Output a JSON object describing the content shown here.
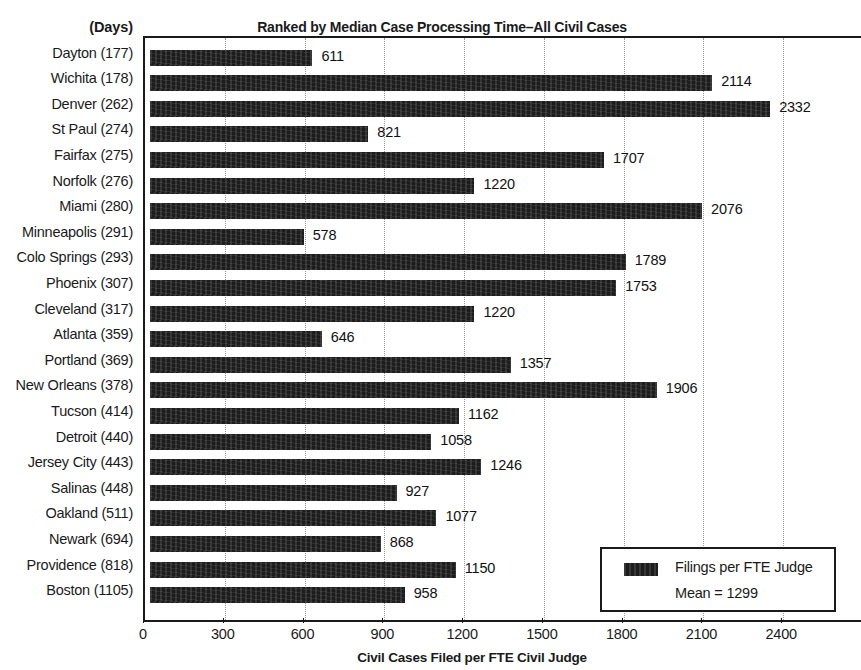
{
  "header": {
    "days_header": "(Days)",
    "title": "Ranked by Median Case Processing Time–All Civil Cases"
  },
  "legend": {
    "series_label": "Filings per FTE Judge",
    "mean_label": "Mean = 1299"
  },
  "chart_data": {
    "type": "bar",
    "orientation": "horizontal",
    "title": "Ranked by Median Case Processing Time–All Civil Cases",
    "xlabel": "Civil Cases Filed per FTE Civil Judge",
    "ylabel": "(Days)",
    "xlim": [
      0,
      2700
    ],
    "xticks": [
      0,
      300,
      600,
      900,
      1200,
      1500,
      1800,
      2100,
      2400
    ],
    "xtick_labels": [
      "0",
      "300",
      "600",
      "900",
      "1200",
      "1500",
      "1800",
      "2100",
      "2400"
    ],
    "grid": "vertical-dotted",
    "legend_position": "bottom-right",
    "series_name": "Filings per FTE Judge",
    "mean": 1299,
    "bar_color": "#1c1c1c",
    "categories": [
      "Dayton (177)",
      "Wichita (178)",
      "Denver (262)",
      "St Paul (274)",
      "Fairfax (275)",
      "Norfolk (276)",
      "Miami (280)",
      "Minneapolis (291)",
      "Colo Springs (293)",
      "Phoenix (307)",
      "Cleveland (317)",
      "Atlanta (359)",
      "Portland (369)",
      "New Orleans (378)",
      "Tucson (414)",
      "Detroit (440)",
      "Jersey City (443)",
      "Salinas (448)",
      "Oakland (511)",
      "Newark (694)",
      "Providence (818)",
      "Boston (1105)"
    ],
    "median_days": [
      177,
      178,
      262,
      274,
      275,
      276,
      280,
      291,
      293,
      307,
      317,
      359,
      369,
      378,
      414,
      440,
      443,
      448,
      511,
      694,
      818,
      1105
    ],
    "values": [
      611,
      2114,
      2332,
      821,
      1707,
      1220,
      2076,
      578,
      1789,
      1753,
      1220,
      646,
      1357,
      1906,
      1162,
      1058,
      1246,
      927,
      1077,
      868,
      1150,
      958
    ],
    "value_labels": [
      "611",
      "2114",
      "2332",
      "821",
      "1707",
      "1220",
      "2076",
      "578",
      "1789",
      "1753",
      "1220",
      "646",
      "1357",
      "1906",
      "1162",
      "1058",
      "1246",
      "927",
      "1077",
      "868",
      "1150",
      "958"
    ]
  }
}
